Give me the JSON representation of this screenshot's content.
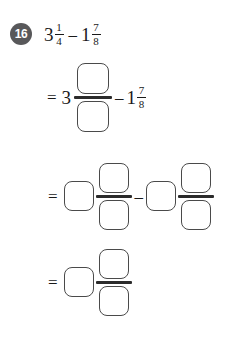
{
  "problem": {
    "number": "16",
    "expression": {
      "left_whole": "3",
      "left_numerator": "1",
      "left_denominator": "4",
      "operator": "–",
      "right_whole": "1",
      "right_numerator": "7",
      "right_denominator": "8"
    }
  },
  "symbols": {
    "equals": "=",
    "minus": "–"
  },
  "step1": {
    "equals": "=",
    "whole": "3",
    "numerator_value": "",
    "denominator_value": "",
    "minus": "–",
    "sub_whole": "1",
    "sub_numerator": "7",
    "sub_denominator": "8"
  },
  "step2": {
    "equals": "=",
    "whole_value": "",
    "numerator_value": "",
    "denominator_value": "",
    "minus": "–",
    "sub_whole_value": "",
    "sub_numerator_value": "",
    "sub_denominator_value": ""
  },
  "step3": {
    "equals": "=",
    "whole_value": "",
    "numerator_value": "",
    "denominator_value": ""
  },
  "colors": {
    "badge_background": "#58585a",
    "badge_text": "#ffffff",
    "ink": "#1a1a1a",
    "box_border": "#4a4a4a",
    "bar": "#2b2b2b",
    "page_background": "#ffffff"
  }
}
